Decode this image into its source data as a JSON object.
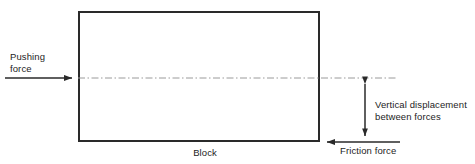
{
  "diagram": {
    "colors": {
      "stroke": "#2a2a2a",
      "centerline": "#9a9a9a",
      "text": "#1d1d1d",
      "background": "#ffffff"
    },
    "labels": {
      "pushing_force_line1": "Pushing",
      "pushing_force_line2": "force",
      "vertical_displacement_line1": "Vertical displacement",
      "vertical_displacement_line2": "between forces",
      "friction_force": "Friction force",
      "block": "Block"
    },
    "geometry": {
      "block": {
        "x": 78,
        "y": 11,
        "width": 242,
        "height": 131
      },
      "pushing_arrow": {
        "x1": 5,
        "y1": 78,
        "x2": 78,
        "y2": 78,
        "direction": "right"
      },
      "friction_arrow": {
        "x1": 400,
        "y1": 142,
        "x2": 320,
        "y2": 142,
        "direction": "left"
      },
      "centerline": {
        "x1": 78,
        "y1": 78,
        "x2": 398,
        "y2": 78,
        "style": "dash-dot"
      },
      "displacement_arrow": {
        "x": 365,
        "y1": 78,
        "y2": 142,
        "direction": "both"
      }
    }
  }
}
